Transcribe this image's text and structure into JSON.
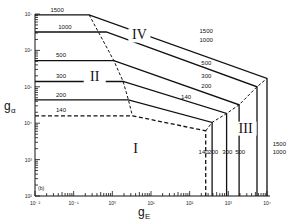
{
  "chart_data": {
    "type": "line",
    "title": "",
    "panel_label": "(b)",
    "xlabel": "g",
    "xlabel_sub": "E",
    "ylabel": "g",
    "ylabel_sub": "α",
    "xscale": "log",
    "yscale": "log",
    "xlim": [
      0.01,
      10000
    ],
    "ylim": [
      100,
      10000000
    ],
    "grid": false,
    "x_ticks": [
      {
        "value": 0.01,
        "label": "10⁻²"
      },
      {
        "value": 0.1,
        "label": "10⁻¹"
      },
      {
        "value": 1,
        "label": "10⁰"
      },
      {
        "value": 10,
        "label": "10¹"
      },
      {
        "value": 100,
        "label": "10²"
      },
      {
        "value": 1000,
        "label": "10³"
      },
      {
        "value": 10000,
        "label": "10⁴"
      }
    ],
    "y_ticks": [
      {
        "value": 100,
        "label": "10²"
      },
      {
        "value": 1000,
        "label": "10³"
      },
      {
        "value": 10000,
        "label": "10⁴"
      },
      {
        "value": 100000,
        "label": "10⁵"
      },
      {
        "value": 1000000,
        "label": "10⁶"
      },
      {
        "value": 10000000,
        "label": "10⁷"
      }
    ],
    "series": [
      {
        "name": "1500",
        "style": "solid",
        "points": [
          [
            0.01,
            9500000
          ],
          [
            0.25,
            9500000
          ],
          [
            10000,
            170000
          ],
          [
            10000,
            100
          ]
        ]
      },
      {
        "name": "1000",
        "style": "solid",
        "points": [
          [
            0.01,
            3200000
          ],
          [
            0.7,
            3200000
          ],
          [
            5500,
            100000
          ],
          [
            5500,
            100
          ]
        ]
      },
      {
        "name": "500",
        "style": "solid",
        "points": [
          [
            0.01,
            520000
          ],
          [
            1.1,
            520000
          ],
          [
            1900,
            32000
          ],
          [
            1900,
            100
          ]
        ]
      },
      {
        "name": "300",
        "style": "solid",
        "points": [
          [
            0.01,
            140000
          ],
          [
            1.9,
            140000
          ],
          [
            900,
            18500
          ],
          [
            900,
            100
          ]
        ]
      },
      {
        "name": "200",
        "style": "solid",
        "points": [
          [
            0.01,
            44000
          ],
          [
            2.6,
            44000
          ],
          [
            380,
            10500
          ],
          [
            380,
            100
          ]
        ]
      },
      {
        "name": "140",
        "style": "dashed",
        "points": [
          [
            0.01,
            16000
          ],
          [
            3.3,
            16000
          ],
          [
            260,
            6200
          ],
          [
            260,
            100
          ]
        ]
      }
    ],
    "boundaries": [
      {
        "name": "region-boundary-left",
        "style": "dashed",
        "points": [
          [
            0.25,
            9500000
          ],
          [
            1.1,
            520000
          ],
          [
            1.9,
            140000
          ],
          [
            2.6,
            44000
          ],
          [
            3.3,
            16000
          ]
        ]
      },
      {
        "name": "region-boundary-right",
        "style": "dashed",
        "points": [
          [
            260,
            6200
          ],
          [
            380,
            10500
          ],
          [
            900,
            18500
          ],
          [
            1900,
            32000
          ],
          [
            5500,
            100000
          ],
          [
            10000,
            170000
          ]
        ]
      }
    ],
    "regions": [
      {
        "label": "I",
        "x": 4,
        "y": 1500
      },
      {
        "label": "II",
        "x": 0.35,
        "y": 140000
      },
      {
        "label": "III",
        "x": 2800,
        "y": 5500
      },
      {
        "label": "IV",
        "x": 5,
        "y": 2000000
      }
    ],
    "curve_labels": [
      {
        "text": "1500",
        "x": 0.025,
        "y": 11500000
      },
      {
        "text": "1000",
        "x": 0.04,
        "y": 3900000
      },
      {
        "text": "500",
        "x": 0.035,
        "y": 640000
      },
      {
        "text": "300",
        "x": 0.035,
        "y": 175000
      },
      {
        "text": "200",
        "x": 0.035,
        "y": 54000
      },
      {
        "text": "140",
        "x": 0.035,
        "y": 20000
      },
      {
        "text": "1500",
        "x": 180,
        "y": 3000000
      },
      {
        "text": "1000",
        "x": 180,
        "y": 1700000
      },
      {
        "text": "500",
        "x": 200,
        "y": 400000
      },
      {
        "text": "300",
        "x": 200,
        "y": 170000
      },
      {
        "text": "200",
        "x": 200,
        "y": 90000
      },
      {
        "text": "140",
        "x": 60,
        "y": 45000
      },
      {
        "text": "140",
        "x": 170,
        "y": 1400
      },
      {
        "text": "200",
        "x": 300,
        "y": 1400
      },
      {
        "text": "300",
        "x": 700,
        "y": 1400
      },
      {
        "text": "500",
        "x": 1500,
        "y": 1400
      },
      {
        "text": "1500",
        "x": 14000,
        "y": 2400
      },
      {
        "text": "1000",
        "x": 14000,
        "y": 1400
      }
    ]
  }
}
